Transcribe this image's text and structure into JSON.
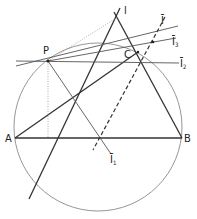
{
  "diagram": {
    "title": "",
    "circle": {
      "cx": 98,
      "cy": 127,
      "r": 84,
      "color": "#888888"
    },
    "points": {
      "P": {
        "label": "P",
        "x": 48,
        "y": 61
      },
      "A": {
        "label": "A",
        "x": 15,
        "y": 138
      },
      "B": {
        "label": "B",
        "x": 182,
        "y": 138
      },
      "C": {
        "label": "C",
        "x": 138,
        "y": 52
      },
      "I": {
        "label": "I",
        "x": 118,
        "y": 17
      }
    },
    "line_labels": {
      "l": "l",
      "lbar": "l̄",
      "lbar1": "l̄",
      "lbar1_sub": "1",
      "lbar2": "l̄",
      "lbar2_sub": "2",
      "lbar3": "l̄",
      "lbar3_sub": "3"
    },
    "labels_text": {
      "P": "P",
      "A": "A",
      "B": "B",
      "C": "C",
      "I": "l",
      "I_bar": "Ī",
      "I_bar_1": "Ī",
      "I_bar_1_sub": "1",
      "I_bar_2": "Ī",
      "I_bar_2_sub": "2",
      "I_bar_3": "Ī",
      "I_bar_3_sub": "3"
    }
  }
}
